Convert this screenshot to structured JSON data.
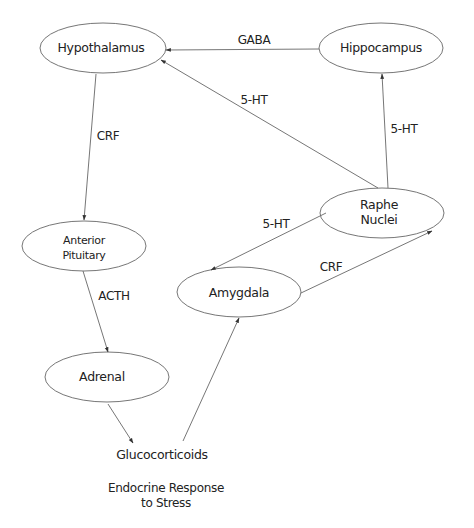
{
  "diagram": {
    "nodes": [
      {
        "id": "hypothalamus",
        "label": "Hypothalamus",
        "cx": 103,
        "cy": 48,
        "rx": 63,
        "ry": 25
      },
      {
        "id": "hippocampus",
        "label": "Hippocampus",
        "cx": 381,
        "cy": 48,
        "rx": 62,
        "ry": 25
      },
      {
        "id": "anterior_pituitary",
        "label_line1": "Anterior",
        "label_line2": "Pituitary",
        "cx": 84,
        "cy": 246,
        "rx": 62,
        "ry": 25
      },
      {
        "id": "raphe_nuclei",
        "label_line1": "Raphe",
        "label_line2": "Nuclei",
        "cx": 382,
        "cy": 213,
        "rx": 62,
        "ry": 25
      },
      {
        "id": "amygdala",
        "label": "Amygdala",
        "cx": 239,
        "cy": 292,
        "rx": 62,
        "ry": 25
      },
      {
        "id": "adrenal",
        "label": "Adrenal",
        "cx": 107,
        "cy": 377,
        "rx": 62,
        "ry": 25
      }
    ],
    "texts": {
      "glucocorticoids": "Glucocorticoids",
      "footer_line1": "Endocrine Response",
      "footer_line2": "to Stress"
    },
    "edges": [
      {
        "from": "hippocampus",
        "to": "hypothalamus",
        "label": "GABA"
      },
      {
        "from": "raphe_nuclei",
        "to": "hypothalamus",
        "label": "5-HT"
      },
      {
        "from": "raphe_nuclei",
        "to": "hippocampus",
        "label": "5-HT"
      },
      {
        "from": "hypothalamus",
        "to": "anterior_pituitary",
        "label": "CRF"
      },
      {
        "from": "raphe_nuclei",
        "to": "amygdala",
        "label": "5-HT"
      },
      {
        "from": "amygdala",
        "to": "raphe_nuclei",
        "label": "CRF"
      },
      {
        "from": "anterior_pituitary",
        "to": "adrenal",
        "label": "ACTH"
      },
      {
        "from": "adrenal",
        "to": "glucocorticoids",
        "label": ""
      },
      {
        "from": "glucocorticoids",
        "to": "amygdala",
        "label": ""
      }
    ],
    "edge_labels": {
      "gaba": "GABA",
      "raphe_hypo_5ht": "5-HT",
      "raphe_hippo_5ht": "5-HT",
      "hypo_pit_crf": "CRF",
      "raphe_amyg_5ht": "5-HT",
      "amyg_raphe_crf": "CRF",
      "pit_adrenal_acth": "ACTH"
    },
    "colors": {
      "stroke": "#555555",
      "text": "#222222",
      "background": "#ffffff"
    }
  }
}
